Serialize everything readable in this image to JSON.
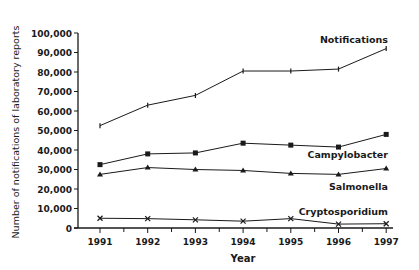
{
  "chart_data": {
    "type": "line",
    "title": "",
    "xlabel": "Year",
    "ylabel": "Number of notifications of laboratory reports",
    "x": [
      "1991",
      "1992",
      "1993",
      "1994",
      "1995",
      "1996",
      "1997"
    ],
    "ylim": [
      0,
      100000
    ],
    "yticks": [
      0,
      10000,
      20000,
      30000,
      40000,
      50000,
      60000,
      70000,
      80000,
      90000,
      100000
    ],
    "ytick_labels": [
      "0",
      "10,000",
      "20,000",
      "30,000",
      "40,000",
      "50,000",
      "60,000",
      "70,000",
      "80,000",
      "90,000",
      "100,000"
    ],
    "grid": false,
    "legend": "inline labels at line ends",
    "series": [
      {
        "name": "Notifications",
        "marker": "tick",
        "values": [
          52500,
          63000,
          68000,
          80500,
          80500,
          81500,
          92000
        ]
      },
      {
        "name": "Campylobacter",
        "marker": "square",
        "values": [
          32500,
          38000,
          38500,
          43500,
          42500,
          41500,
          48000
        ]
      },
      {
        "name": "Salmonella",
        "marker": "triangle",
        "values": [
          27500,
          31000,
          30000,
          29500,
          28000,
          27500,
          30500
        ]
      },
      {
        "name": "Cryptosporidium",
        "marker": "x",
        "values": [
          5000,
          4800,
          4200,
          3500,
          4800,
          2000,
          2200
        ]
      }
    ]
  }
}
